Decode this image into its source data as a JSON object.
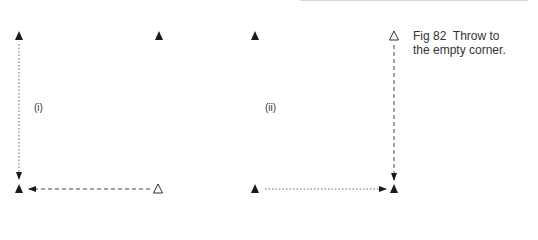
{
  "figure": {
    "caption_line1": "Fig 82  Throw to",
    "caption_line2": "the empty corner.",
    "panels": [
      {
        "label": "(i)",
        "players": [
          {
            "position": "top-left",
            "marker": "filled-triangle"
          },
          {
            "position": "top-right",
            "marker": "filled-triangle"
          },
          {
            "position": "bottom-left",
            "marker": "filled-triangle"
          },
          {
            "position": "bottom-right",
            "marker": "open-triangle"
          }
        ],
        "movements": [
          {
            "from": "top-left",
            "to": "bottom-left",
            "style": "dotted",
            "meaning": "player run"
          },
          {
            "from": "bottom-right",
            "to": "bottom-left",
            "style": "dashed",
            "meaning": "throw"
          }
        ]
      },
      {
        "label": "(ii)",
        "players": [
          {
            "position": "top-left",
            "marker": "filled-triangle"
          },
          {
            "position": "top-right",
            "marker": "open-triangle"
          },
          {
            "position": "bottom-left",
            "marker": "filled-triangle"
          },
          {
            "position": "bottom-right",
            "marker": "filled-triangle"
          }
        ],
        "movements": [
          {
            "from": "top-right",
            "to": "bottom-right",
            "style": "dashed",
            "meaning": "throw"
          },
          {
            "from": "bottom-left",
            "to": "bottom-right",
            "style": "dotted",
            "meaning": "player run"
          }
        ]
      }
    ],
    "colors": {
      "ink": "#1a1a1a",
      "line": "#555555"
    }
  }
}
